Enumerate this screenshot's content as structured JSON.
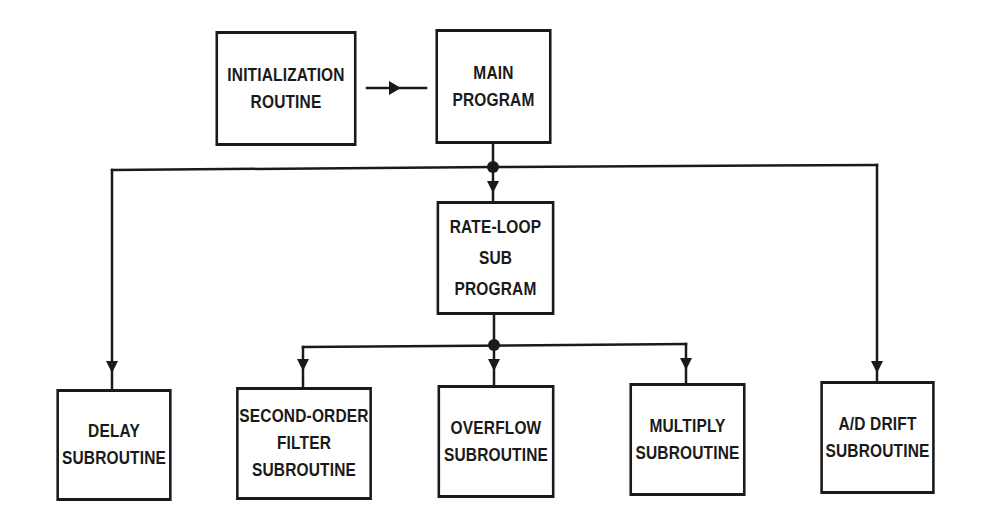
{
  "diagram": {
    "type": "flowchart",
    "colors": {
      "line": "#1a1a1a",
      "background": "#ffffff"
    },
    "nodes": {
      "init": {
        "lines": [
          "INITIALIZATION",
          "ROUTINE"
        ]
      },
      "main": {
        "lines": [
          "MAIN",
          "PROGRAM"
        ]
      },
      "rateloop": {
        "lines": [
          "RATE-LOOP",
          "SUB",
          "PROGRAM"
        ]
      },
      "delay": {
        "lines": [
          "DELAY",
          "SUBROUTINE"
        ]
      },
      "filter": {
        "lines": [
          "SECOND-ORDER",
          "FILTER",
          "SUBROUTINE"
        ]
      },
      "overflow": {
        "lines": [
          "OVERFLOW",
          "SUBROUTINE"
        ]
      },
      "multiply": {
        "lines": [
          "MULTIPLY",
          "SUBROUTINE"
        ]
      },
      "addrift": {
        "lines": [
          "A/D DRIFT",
          "SUBROUTINE"
        ]
      }
    },
    "edges": [
      {
        "from": "init",
        "to": "main"
      },
      {
        "from": "main",
        "to": "rateloop"
      },
      {
        "from": "main",
        "to": "delay"
      },
      {
        "from": "main",
        "to": "addrift"
      },
      {
        "from": "rateloop",
        "to": "filter"
      },
      {
        "from": "rateloop",
        "to": "overflow"
      },
      {
        "from": "rateloop",
        "to": "multiply"
      }
    ]
  }
}
